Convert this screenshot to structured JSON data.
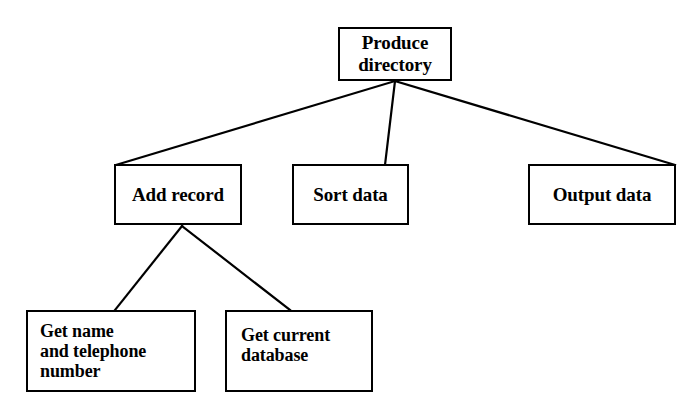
{
  "diagram": {
    "type": "hierarchy-structure-chart",
    "background_color": "#ffffff",
    "line_color": "#000000",
    "text_color": "#000000",
    "nodes": {
      "root": {
        "label": "Produce\ndirectory"
      },
      "add_record": {
        "label": "Add record"
      },
      "sort_data": {
        "label": "Sort data"
      },
      "output_data": {
        "label": "Output data"
      },
      "get_name": {
        "label": "Get name\nand telephone\nnumber"
      },
      "get_database": {
        "label": "Get current\ndatabase"
      }
    },
    "edges": [
      {
        "from": "root",
        "to": "add_record"
      },
      {
        "from": "root",
        "to": "sort_data"
      },
      {
        "from": "root",
        "to": "output_data"
      },
      {
        "from": "add_record",
        "to": "get_name"
      },
      {
        "from": "add_record",
        "to": "get_database"
      }
    ]
  }
}
